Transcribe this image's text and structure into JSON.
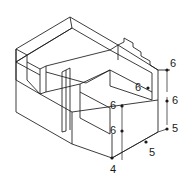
{
  "figure": {
    "type": "isometric-technical-drawing",
    "background_color": "#ffffff",
    "line_color": "#1a1a1a",
    "projection": "isometric"
  },
  "dimensions": [
    {
      "id": "dim-top-right-height",
      "value": "6",
      "x": 170,
      "y": 64,
      "marker": "dot"
    },
    {
      "id": "dim-inner-sloped-face",
      "value": "6",
      "x": 135,
      "y": 82,
      "marker": "dot"
    },
    {
      "id": "dim-right-middle-height",
      "value": "6",
      "x": 170,
      "y": 99,
      "marker": "dot"
    },
    {
      "id": "dim-inner-block-height",
      "value": "6",
      "x": 110,
      "y": 104,
      "marker": "dot"
    },
    {
      "id": "dim-lower-front-height",
      "value": "6",
      "x": 110,
      "y": 129,
      "marker": "dot"
    },
    {
      "id": "dim-right-depth",
      "value": "5",
      "x": 170,
      "y": 127,
      "marker": "dot"
    },
    {
      "id": "dim-bottom-right-run",
      "value": "5",
      "x": 148,
      "y": 148,
      "marker": "dot"
    },
    {
      "id": "dim-bottom-front-corner",
      "value": "4",
      "x": 111,
      "y": 165,
      "marker": "dot"
    }
  ],
  "labels": {
    "6": "6",
    "5": "5",
    "4": "4"
  }
}
